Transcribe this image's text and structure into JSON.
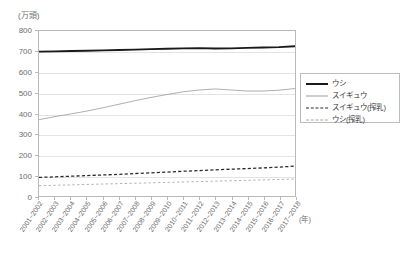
{
  "chart_data": {
    "type": "line",
    "title": "",
    "xlabel": "(年)",
    "ylabel": "(万頭)",
    "ylim": [
      0,
      800
    ],
    "ytick_values": [
      0,
      100,
      200,
      300,
      400,
      500,
      600,
      700,
      800
    ],
    "ytick_labels": [
      "0",
      "100",
      "200",
      "300",
      "400",
      "500",
      "600",
      "700",
      "800"
    ],
    "grid": true,
    "legend_position": "right",
    "categories": [
      "2001~2002",
      "2002~2003",
      "2003~2004",
      "2004~2005",
      "2005~2006",
      "2006~2007",
      "2007~2008",
      "2008~2009",
      "2009~2010",
      "2010~2011",
      "2011~2012",
      "2012~2013",
      "2013~2014",
      "2014~2015",
      "2015~2016",
      "2016~2017",
      "2017~2018"
    ],
    "series": [
      {
        "name": "ウシ",
        "style": "solid-thick",
        "color": "#1a1a1a",
        "values": [
          700,
          701,
          703,
          704,
          706,
          708,
          710,
          712,
          714,
          716,
          717,
          715,
          716,
          718,
          720,
          722,
          726
        ]
      },
      {
        "name": "スイギュウ",
        "style": "solid-thin",
        "color": "#9a9a9a",
        "values": [
          370,
          385,
          398,
          412,
          428,
          445,
          462,
          478,
          492,
          505,
          514,
          519,
          514,
          509,
          509,
          513,
          521
        ]
      },
      {
        "name": "スイギュウ(搾乳)",
        "style": "dashed",
        "color": "#2b2b2b",
        "values": [
          90,
          93,
          96,
          99,
          102,
          105,
          109,
          112,
          116,
          120,
          123,
          127,
          130,
          133,
          136,
          140,
          145
        ]
      },
      {
        "name": "ウシ(搾乳)",
        "style": "dotted",
        "color": "#a8a8a8",
        "values": [
          50,
          52,
          54,
          56,
          58,
          60,
          62,
          64,
          66,
          68,
          70,
          72,
          74,
          76,
          78,
          80,
          82
        ]
      }
    ]
  },
  "legend": {
    "entries": [
      {
        "label": "ウシ"
      },
      {
        "label": "スイギュウ"
      },
      {
        "label": "スイギュウ(搾乳)"
      },
      {
        "label": "ウシ(搾乳)"
      }
    ]
  }
}
